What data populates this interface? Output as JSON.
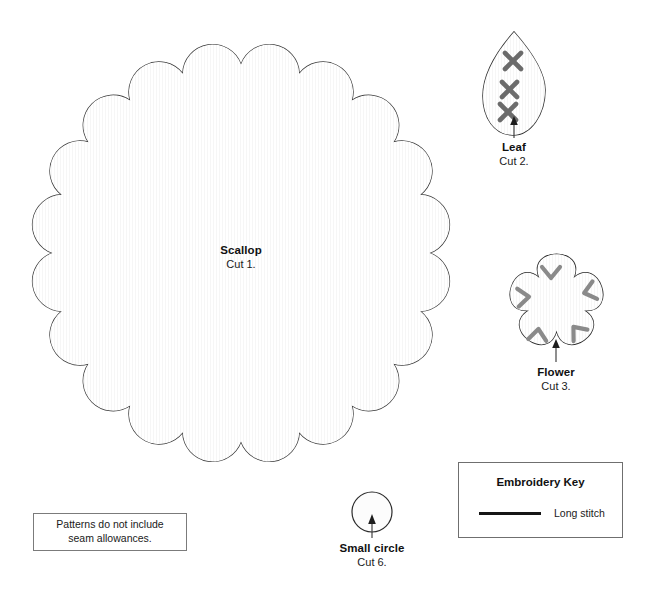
{
  "sheet": {
    "width": 652,
    "height": 594,
    "background": "#ffffff",
    "title": "Sewing pattern template sheet"
  },
  "colors": {
    "outline": "#3a3a3a",
    "scallop_fill": "#f0f0f0",
    "leaf_fill": "#c9c9c9",
    "leaf_stitch": "#6b6b6b",
    "flower_fill": "#e6e6e6",
    "flower_stitch": "#8a8a8a",
    "circle_fill": "#fcfcfc",
    "box_border": "#6f6f6f",
    "stitch_key_line": "#151515",
    "text": "#111111",
    "leader_line": "#333333"
  },
  "pieces": [
    {
      "id": "scallop",
      "name": "Scallop",
      "cut": "Cut 1.",
      "shape": "scalloped-circle",
      "scallops": 20,
      "fill": "#f0f0f0",
      "center": {
        "x": 241,
        "y": 253
      },
      "radius": 213,
      "label_position": "centered-inside",
      "stitches": []
    },
    {
      "id": "leaf",
      "name": "Leaf",
      "cut": "Cut 2.",
      "shape": "teardrop-leaf",
      "fill": "#c9c9c9",
      "bounds": {
        "x": 483,
        "y": 32,
        "width": 62,
        "height": 103
      },
      "label_position": "below-with-leader",
      "stitch_type": "cross",
      "stitch_count": 3
    },
    {
      "id": "flower",
      "name": "Flower",
      "cut": "Cut 3.",
      "shape": "five-petal-flower",
      "petals": 5,
      "fill": "#e6e6e6",
      "bounds": {
        "x": 508,
        "y": 248,
        "width": 97,
        "height": 107
      },
      "label_position": "below-with-leader",
      "stitch_type": "chevron",
      "stitch_count": 5
    },
    {
      "id": "small-circle",
      "name": "Small circle",
      "cut": "Cut 6.",
      "shape": "circle",
      "fill": "#fcfcfc",
      "center": {
        "x": 372,
        "y": 512
      },
      "radius": 20,
      "label_position": "below-with-leader",
      "stitches": []
    }
  ],
  "note_box": {
    "lines": [
      "Patterns do not include",
      "seam allowances."
    ]
  },
  "embroidery_key": {
    "title": "Embroidery Key",
    "entries": [
      {
        "swatch": "long-stitch-line",
        "label": "Long stitch"
      }
    ]
  }
}
